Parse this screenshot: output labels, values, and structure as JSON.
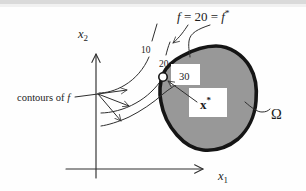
{
  "colors": {
    "region_fill": "#989898",
    "region_stroke": "#151515",
    "line": "#2e2e2e",
    "text": "#1c1c1c",
    "scan_edge": "#d4d4d4",
    "background": "#fefefe"
  },
  "annotation": {
    "f1": "f",
    "equals": " = 20 = ",
    "f2": "f",
    "star": "*"
  },
  "axes": {
    "x2_base": "x",
    "x2_sub": "2",
    "x1_base": "x",
    "x1_sub": "1"
  },
  "contours": {
    "label": "contours of ",
    "label_f": "f",
    "level_10": "10",
    "level_20": "20",
    "level_30": "30"
  },
  "optimum": {
    "base": "x",
    "star": "*"
  },
  "region": {
    "label": "Ω"
  }
}
